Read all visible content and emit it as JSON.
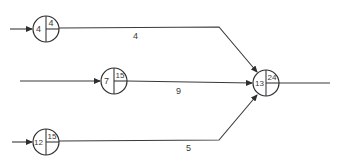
{
  "diagram": {
    "type": "activity-network",
    "nodes": [
      {
        "id": "n1",
        "left_value": "4",
        "top_right_value": "4"
      },
      {
        "id": "n2",
        "left_value": "7",
        "top_right_value": "15"
      },
      {
        "id": "n3",
        "left_value": "12",
        "top_right_value": "15"
      },
      {
        "id": "n4",
        "left_value": "13",
        "top_right_value": "24"
      }
    ],
    "edges": [
      {
        "from": "n1",
        "to": "n4",
        "label": "4"
      },
      {
        "from": "n2",
        "to": "n4",
        "label": "9"
      },
      {
        "from": "n3",
        "to": "n4",
        "label": "5"
      }
    ],
    "colors": {
      "line": "#3a3a3a",
      "background": "#ffffff"
    }
  }
}
